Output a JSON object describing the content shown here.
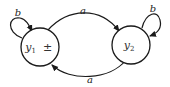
{
  "diagram": {
    "type": "finite-automaton",
    "nodes": [
      {
        "id": "y1",
        "label": "y",
        "subscript": "1",
        "marker": "±",
        "initial": true,
        "final": true
      },
      {
        "id": "y2",
        "label": "y",
        "subscript": "2",
        "marker": ""
      }
    ],
    "edges": [
      {
        "from": "y1",
        "to": "y1",
        "label": "b"
      },
      {
        "from": "y1",
        "to": "y2",
        "label": "a"
      },
      {
        "from": "y2",
        "to": "y2",
        "label": "b"
      },
      {
        "from": "y2",
        "to": "y1",
        "label": "a"
      }
    ]
  }
}
